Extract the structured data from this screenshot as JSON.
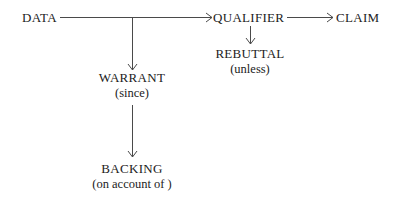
{
  "diagram": {
    "nodes": {
      "data": {
        "label": "DATA"
      },
      "qualifier": {
        "label": "QUALIFIER"
      },
      "claim": {
        "label": "CLAIM"
      },
      "rebuttal": {
        "label": "REBUTTAL",
        "sub": "(unless)"
      },
      "warrant": {
        "label": "WARRANT",
        "sub": "(since)"
      },
      "backing": {
        "label": "BACKING",
        "sub": "(on account of )"
      }
    },
    "edges": [
      {
        "from": "DATA",
        "to": "QUALIFIER",
        "type": "arrow"
      },
      {
        "from": "QUALIFIER",
        "to": "CLAIM",
        "type": "arrow"
      },
      {
        "from": "QUALIFIER",
        "to": "REBUTTAL",
        "type": "arrow"
      },
      {
        "from": "DATA-QUALIFIER line",
        "to": "WARRANT",
        "type": "arrow"
      },
      {
        "from": "WARRANT",
        "to": "BACKING",
        "type": "arrow"
      }
    ],
    "colors": {
      "text": "#222222",
      "line": "#4a4a4a",
      "background": "#ffffff"
    }
  }
}
